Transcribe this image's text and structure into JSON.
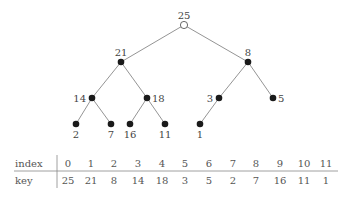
{
  "tree": {
    "nodes": [
      {
        "index": 0,
        "key": "25",
        "x": 184,
        "y": 25,
        "style": "hollow",
        "label_pos": "top"
      },
      {
        "index": 1,
        "key": "21",
        "x": 121,
        "y": 62,
        "style": "filled",
        "label_pos": "top"
      },
      {
        "index": 2,
        "key": "8",
        "x": 248,
        "y": 62,
        "style": "filled",
        "label_pos": "top"
      },
      {
        "index": 3,
        "key": "14",
        "x": 92,
        "y": 98,
        "style": "filled",
        "label_pos": "left"
      },
      {
        "index": 4,
        "key": "18",
        "x": 147,
        "y": 98,
        "style": "filled",
        "label_pos": "right"
      },
      {
        "index": 5,
        "key": "3",
        "x": 219,
        "y": 98,
        "style": "filled",
        "label_pos": "left"
      },
      {
        "index": 6,
        "key": "5",
        "x": 273,
        "y": 98,
        "style": "filled",
        "label_pos": "right"
      },
      {
        "index": 7,
        "key": "2",
        "x": 76,
        "y": 124,
        "style": "filled",
        "label_pos": "bottom"
      },
      {
        "index": 8,
        "key": "7",
        "x": 111,
        "y": 124,
        "style": "filled",
        "label_pos": "bottom"
      },
      {
        "index": 9,
        "key": "16",
        "x": 130,
        "y": 124,
        "style": "filled",
        "label_pos": "bottom"
      },
      {
        "index": 10,
        "key": "11",
        "x": 165,
        "y": 124,
        "style": "filled",
        "label_pos": "bottom"
      },
      {
        "index": 11,
        "key": "1",
        "x": 200,
        "y": 124,
        "style": "filled",
        "label_pos": "bottom"
      }
    ],
    "edges": [
      [
        0,
        1
      ],
      [
        0,
        2
      ],
      [
        1,
        3
      ],
      [
        1,
        4
      ],
      [
        2,
        5
      ],
      [
        2,
        6
      ],
      [
        3,
        7
      ],
      [
        3,
        8
      ],
      [
        4,
        9
      ],
      [
        4,
        10
      ],
      [
        5,
        11
      ]
    ]
  },
  "table": {
    "row_headers": [
      "index",
      "key"
    ],
    "index": [
      "0",
      "1",
      "2",
      "3",
      "4",
      "5",
      "6",
      "7",
      "8",
      "9",
      "10",
      "11"
    ],
    "key": [
      "25",
      "21",
      "8",
      "14",
      "18",
      "3",
      "5",
      "2",
      "7",
      "16",
      "11",
      "1"
    ],
    "column_x": [
      68,
      91,
      114,
      138,
      162,
      185,
      209,
      233,
      256,
      280,
      304,
      326
    ]
  },
  "colors": {
    "line": "#888888",
    "node": "#1a1a1a",
    "text": "#444444"
  }
}
